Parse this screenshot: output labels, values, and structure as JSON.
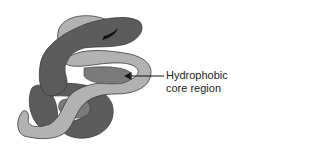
{
  "diagram": {
    "annotation": {
      "line1": "Hydrophobic",
      "line2": "core region"
    },
    "colors": {
      "dark": "#5c5c5c",
      "medium": "#7a7a7a",
      "light": "#b2b2b2",
      "outline": "#3a3a3a",
      "tip": "#111111",
      "arrow": "#111111"
    }
  }
}
